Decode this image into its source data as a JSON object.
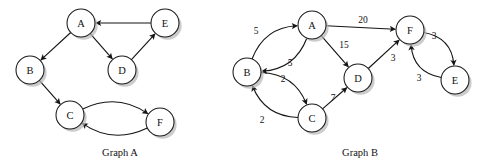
{
  "figure": {
    "width": 491,
    "height": 164,
    "background": "#ffffff",
    "ink_color": "#151515",
    "node_fill": "#ffffff",
    "shadow_color": "#b9b9b9"
  },
  "graphs": [
    {
      "id": "graph-a",
      "caption": "Graph A",
      "caption_x": 120,
      "caption_y": 152,
      "weighted": false,
      "directed": true,
      "node_radius": 14,
      "nodes": [
        {
          "id": "A",
          "label": "A",
          "x": 81,
          "y": 23
        },
        {
          "id": "E",
          "label": "E",
          "x": 165,
          "y": 23
        },
        {
          "id": "B",
          "label": "B",
          "x": 30,
          "y": 70
        },
        {
          "id": "D",
          "label": "D",
          "x": 122,
          "y": 70
        },
        {
          "id": "C",
          "label": "C",
          "x": 70,
          "y": 115
        },
        {
          "id": "F",
          "label": "F",
          "x": 160,
          "y": 122
        }
      ],
      "edges": [
        {
          "from": "E",
          "to": "A",
          "curve": 0,
          "weight": null
        },
        {
          "from": "A",
          "to": "B",
          "curve": 0,
          "weight": null
        },
        {
          "from": "A",
          "to": "D",
          "curve": 0,
          "weight": null
        },
        {
          "from": "D",
          "to": "E",
          "curve": 0,
          "weight": null
        },
        {
          "from": "B",
          "to": "C",
          "curve": 0,
          "weight": null
        },
        {
          "from": "C",
          "to": "F",
          "curve": -13,
          "weight": null
        },
        {
          "from": "F",
          "to": "C",
          "curve": -13,
          "weight": null
        }
      ]
    },
    {
      "id": "graph-b",
      "caption": "Graph B",
      "caption_x": 360,
      "caption_y": 152,
      "weighted": true,
      "directed": true,
      "node_radius": 14,
      "nodes": [
        {
          "id": "A",
          "label": "A",
          "x": 312,
          "y": 25
        },
        {
          "id": "F",
          "label": "F",
          "x": 410,
          "y": 30
        },
        {
          "id": "B",
          "label": "B",
          "x": 247,
          "y": 72
        },
        {
          "id": "D",
          "label": "D",
          "x": 358,
          "y": 78
        },
        {
          "id": "E",
          "label": "E",
          "x": 455,
          "y": 80
        },
        {
          "id": "C",
          "label": "C",
          "x": 312,
          "y": 118
        }
      ],
      "edges": [
        {
          "from": "B",
          "to": "A",
          "curve": -13,
          "weight": "5",
          "wx": 256,
          "wy": 31
        },
        {
          "from": "A",
          "to": "B",
          "curve": -13,
          "weight": "5",
          "wx": 290,
          "wy": 63
        },
        {
          "from": "A",
          "to": "F",
          "curve": 0,
          "weight": "20",
          "wx": 363,
          "wy": 20
        },
        {
          "from": "A",
          "to": "D",
          "curve": 0,
          "weight": "15",
          "wx": 344,
          "wy": 45
        },
        {
          "from": "B",
          "to": "C",
          "curve": -13,
          "weight": "2",
          "wx": 283,
          "wy": 79
        },
        {
          "from": "C",
          "to": "B",
          "curve": -13,
          "weight": "2",
          "wx": 262,
          "wy": 120
        },
        {
          "from": "C",
          "to": "D",
          "curve": 0,
          "weight": "7",
          "wx": 333,
          "wy": 98
        },
        {
          "from": "D",
          "to": "F",
          "curve": 0,
          "weight": "3",
          "wx": 393,
          "wy": 58
        },
        {
          "from": "F",
          "to": "E",
          "curve": -13,
          "weight": "3",
          "wx": 434,
          "wy": 36
        },
        {
          "from": "E",
          "to": "F",
          "curve": -13,
          "weight": "3",
          "wx": 419,
          "wy": 78
        }
      ]
    }
  ]
}
